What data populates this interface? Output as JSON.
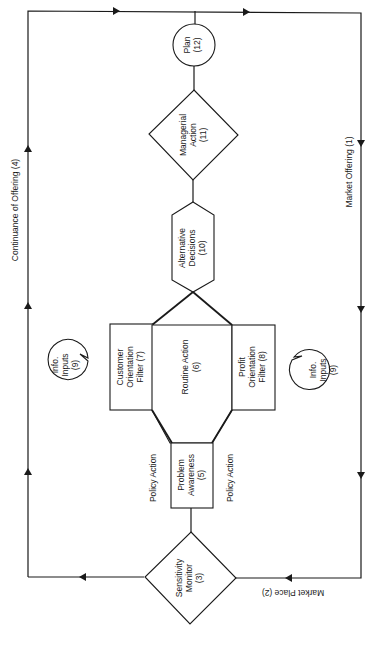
{
  "diagram": {
    "nodes": {
      "plan": {
        "line1": "Plan",
        "line2": "(12)"
      },
      "managerial_action": {
        "line1": "Managerial",
        "line2": "Action",
        "line3": "(11)"
      },
      "alternative_decisions": {
        "line1": "Alternative",
        "line2": "Decisions",
        "line3": "(10)"
      },
      "customer_filter": {
        "line1": "Customer",
        "line2": "Orientation",
        "line3": "Filter (7)"
      },
      "routine_action": {
        "line1": "Routine Action",
        "line2": "(6)"
      },
      "profit_filter": {
        "line1": "Profit",
        "line2": "Orientation",
        "line3": "Filter (8)"
      },
      "info_inputs_left": {
        "line1": "Info.",
        "line2": "Inputs",
        "line3": "(9)"
      },
      "info_inputs_right": {
        "line1": "Info.",
        "line2": "Inputs",
        "line3": "(9)"
      },
      "problem_awareness": {
        "line1": "Problem",
        "line2": "Awareness",
        "line3": "(5)"
      },
      "sensitivity_monitor": {
        "line1": "Sensitivity",
        "line2": "Monitor",
        "line3": "(3)"
      }
    },
    "edge_labels": {
      "continuance": "Continuance of Offering (4)",
      "market_offering": "Market Offering (1)",
      "market_place": "Market Place (2)",
      "policy_action_left": "Policy Action",
      "policy_action_right": "Policy Action"
    }
  }
}
